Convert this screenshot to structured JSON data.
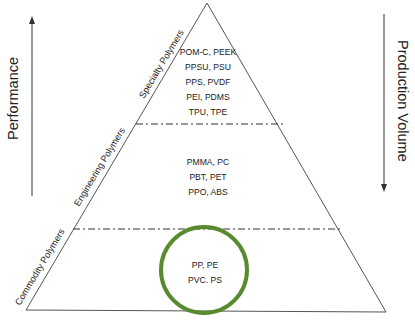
{
  "diagram": {
    "type": "pyramid",
    "colors": {
      "outline": "#555555",
      "divider": "#333333",
      "highlight_circle": "#5a8a2e",
      "text": "#222222"
    },
    "left_axis": {
      "label": "Performance",
      "direction": "up"
    },
    "right_axis": {
      "label": "Production Volume",
      "direction": "down"
    },
    "tiers": [
      {
        "name": "Specialty Polymers",
        "items": [
          "POM-C, PEEK",
          "PPSU, PSU",
          "PPS, PVDF",
          "PEI, PDMS",
          "TPU, TPE"
        ]
      },
      {
        "name": "Engineering Polymers",
        "items": [
          "PMMA, PC",
          "PBT, PET",
          "PPO, ABS"
        ]
      },
      {
        "name": "Commodity Polymers",
        "items": [
          "PP, PE",
          "PVC. PS"
        ],
        "highlighted": true
      }
    ]
  }
}
